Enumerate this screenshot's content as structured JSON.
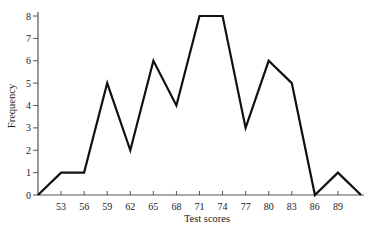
{
  "chart_data": {
    "type": "line",
    "title": "",
    "xlabel": "Test scores",
    "ylabel": "Frequency",
    "x": [
      50,
      53,
      56,
      59,
      62,
      65,
      68,
      71,
      74,
      77,
      80,
      83,
      86,
      89,
      92
    ],
    "series": [
      {
        "name": "Frequency polygon",
        "values": [
          0,
          1,
          1,
          5,
          2,
          6,
          4,
          8,
          8,
          3,
          6,
          5,
          0,
          1,
          0
        ]
      }
    ],
    "x_tick_labels": [
      "53",
      "56",
      "59",
      "62",
      "65",
      "68",
      "71",
      "74",
      "77",
      "80",
      "83",
      "86",
      "89"
    ],
    "x_ticks": [
      53,
      56,
      59,
      62,
      65,
      68,
      71,
      74,
      77,
      80,
      83,
      86,
      89
    ],
    "y_ticks": [
      0,
      1,
      2,
      3,
      4,
      5,
      6,
      7,
      8
    ],
    "xlim": [
      50,
      92
    ],
    "ylim": [
      0,
      8
    ],
    "grid": false,
    "legend": "none",
    "line_color": "#111111",
    "axis_color": "#555555"
  }
}
